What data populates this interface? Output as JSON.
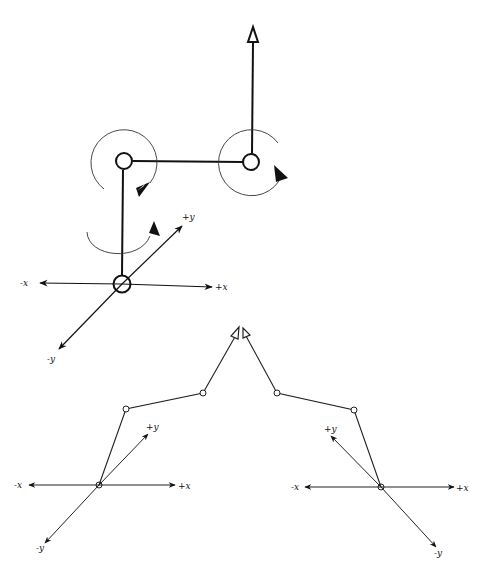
{
  "diagram": {
    "title": "",
    "colors": {
      "stroke": "#111111",
      "background": "#ffffff"
    },
    "top_figure": {
      "axes_labels": {
        "neg_x": "-x",
        "pos_x": "+x",
        "pos_y": "+y",
        "neg_y": "-y"
      },
      "joints": [
        "base-joint",
        "shoulder-joint",
        "elbow-joint"
      ],
      "rotation_arrows": 3,
      "end_arrow": "open-triangle-up"
    },
    "bottom_left_figure": {
      "axes_labels": {
        "neg_x": "-x",
        "pos_x": "+x",
        "pos_y": "+y",
        "neg_y": "-y"
      }
    },
    "bottom_right_figure": {
      "axes_labels": {
        "neg_x": "-x",
        "pos_x": "+x",
        "pos_y": "+y",
        "neg_y": "-y"
      }
    }
  }
}
